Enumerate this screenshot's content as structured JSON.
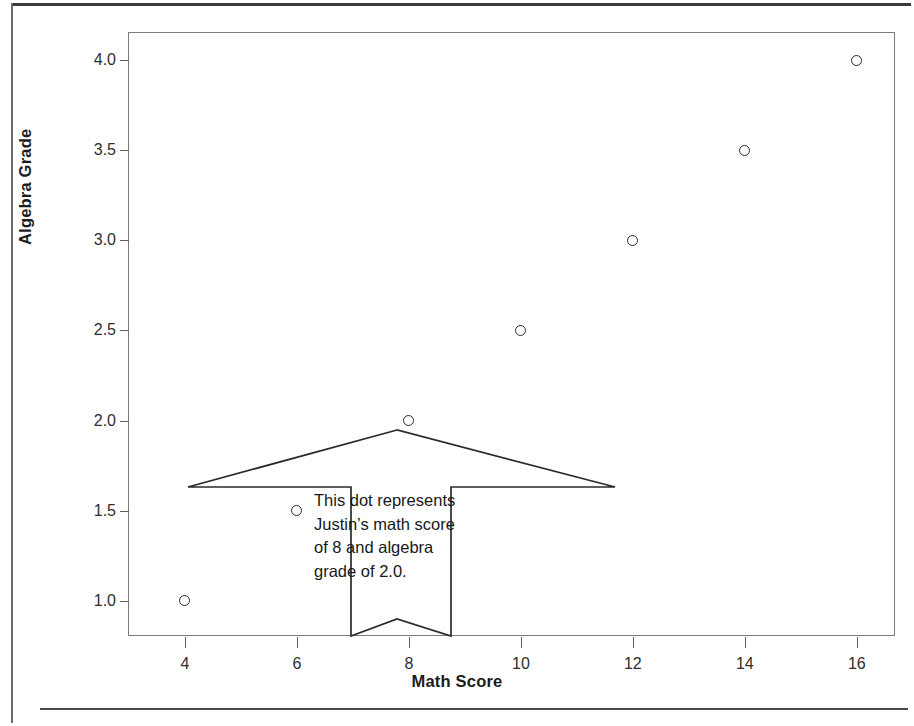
{
  "chart_data": {
    "type": "scatter",
    "title": "",
    "xlabel": "Math Score",
    "ylabel": "Algebra Grade",
    "xlim": [
      3.0,
      16.7
    ],
    "ylim": [
      0.8,
      4.15
    ],
    "grid": false,
    "legend": "none",
    "x": [
      4,
      6,
      8,
      10,
      12,
      14,
      16
    ],
    "y": [
      1.0,
      1.5,
      2.0,
      2.5,
      3.0,
      3.5,
      4.0
    ],
    "points": [
      {
        "x": 4,
        "y": 1.0
      },
      {
        "x": 6,
        "y": 1.5
      },
      {
        "x": 8,
        "y": 2.0
      },
      {
        "x": 10,
        "y": 2.5
      },
      {
        "x": 12,
        "y": 3.0
      },
      {
        "x": 14,
        "y": 3.5
      },
      {
        "x": 16,
        "y": 4.0
      }
    ],
    "xticks": [
      4,
      6,
      8,
      10,
      12,
      14,
      16
    ],
    "xticklabels": [
      "4",
      "6",
      "8",
      "10",
      "12",
      "14",
      "16"
    ],
    "yticks": [
      1.0,
      1.5,
      2.0,
      2.5,
      3.0,
      3.5,
      4.0
    ],
    "yticklabels": [
      "1.0",
      "1.5",
      "2.0",
      "2.5",
      "3.0",
      "3.5",
      "4.0"
    ],
    "marker": "open-circle",
    "marker_color": "#2b2b2b",
    "annotations": [
      {
        "target": {
          "x": 8,
          "y": 2.0
        },
        "shape": "up-arrow-banner",
        "lines": [
          "This dot represents",
          "Justin’s math score",
          "of 8 and algebra",
          "grade of 2.0."
        ]
      }
    ]
  },
  "axes": {
    "x_title": "Math Score",
    "y_title": "Algebra Grade"
  },
  "callout": {
    "line1": "This dot represents",
    "line2": "Justin’s math score",
    "line3": "of 8 and algebra",
    "line4": "grade of 2.0."
  },
  "bleed": {
    "line1": "",
    "line2": ""
  },
  "colors": {
    "marker": "#2b2b2b",
    "plot_border": "#7b7b7b",
    "axis_text": "#2e2e2e",
    "title_text": "#1c1c1c",
    "page_rule": "#3a3a3a"
  }
}
